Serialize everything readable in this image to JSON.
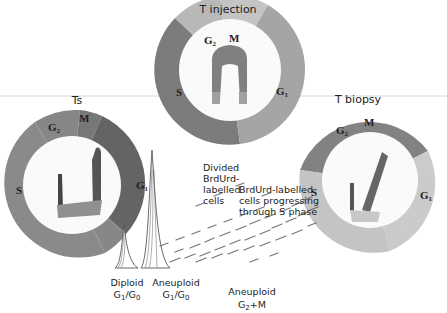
{
  "diagram": {
    "panels": [
      {
        "id": "t_injection",
        "title": "T injection",
        "segments": [
          {
            "label": "G",
            "sub": "2",
            "shade": "#bdbdbd"
          },
          {
            "label": "M",
            "sub": "",
            "shade": "#c6c6c6"
          },
          {
            "label": "G",
            "sub": "1",
            "shade": "#a9a9a9"
          },
          {
            "label": "S",
            "sub": "",
            "shade": "#7c7c7c"
          }
        ]
      },
      {
        "id": "ts",
        "title": "Ts",
        "segments": [
          {
            "label": "G",
            "sub": "2",
            "shade": "#8a8a8a"
          },
          {
            "label": "M",
            "sub": "",
            "shade": "#7a7a7a"
          },
          {
            "label": "G",
            "sub": "1",
            "shade": "#6a6a6a"
          },
          {
            "label": "S",
            "sub": "",
            "shade": "#8f8f8f"
          }
        ]
      },
      {
        "id": "t_biopsy",
        "title": "T biopsy",
        "segments": [
          {
            "label": "G",
            "sub": "2",
            "shade": "#858585"
          },
          {
            "label": "M",
            "sub": "",
            "shade": "#8c8c8c"
          },
          {
            "label": "G",
            "sub": "1",
            "shade": "#d0d0d0"
          },
          {
            "label": "S",
            "sub": "",
            "shade": "#c4c4c4"
          }
        ]
      }
    ],
    "annotations": {
      "divided": [
        "Divided",
        "BrdUrd-",
        "labelled",
        "cells"
      ],
      "progressing": [
        "BrdUrd-labelled",
        "cells progressing",
        "through S phase"
      ],
      "diploid": {
        "line1": "Diploid",
        "line2_a": "G",
        "line2_a_sub": "1",
        "line2_b": "/G",
        "line2_b_sub": "0"
      },
      "aneuploid_g1": {
        "line1": "Aneuploid",
        "line2_a": "G",
        "line2_a_sub": "1",
        "line2_b": "/G",
        "line2_b_sub": "0"
      },
      "aneuploid_g2": {
        "line1": "Aneuploid",
        "line2_a": "G",
        "line2_a_sub": "2",
        "line2_b": "+M",
        "line2_b_sub": ""
      }
    }
  }
}
